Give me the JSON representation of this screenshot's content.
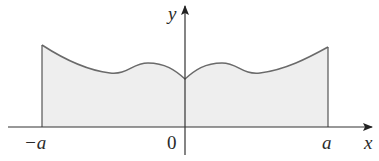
{
  "diagram": {
    "type": "even-function-area",
    "axes": {
      "x_label": "x",
      "y_label": "y"
    },
    "ticks": {
      "left": "−a",
      "origin": "0",
      "right": "a"
    },
    "colors": {
      "fill": "#eeeeee",
      "curve": "#6a6a6a",
      "axis": "#333333",
      "text": "#2a2a2a"
    }
  }
}
